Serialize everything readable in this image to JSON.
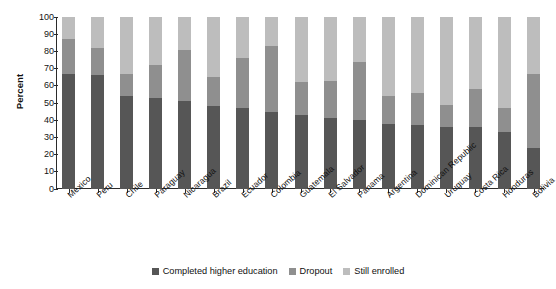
{
  "chart_data": {
    "type": "bar",
    "subtype": "stacked-bar-vertical",
    "title": "",
    "subtitle": "",
    "xlabel": "",
    "ylabel": "Percent",
    "ylim": [
      0,
      100
    ],
    "ytick_step": 10,
    "yticks": [
      100,
      90,
      80,
      70,
      60,
      50,
      40,
      30,
      20,
      10,
      0
    ],
    "grid": false,
    "legend_position": "bottom-center",
    "stacked_total": 100,
    "categories": [
      "Mexico",
      "Peru",
      "Chile",
      "Paraguay",
      "Nicaragua",
      "Brazil",
      "Ecuador",
      "Colombia",
      "Guatemala",
      "El Salvador",
      "Panama",
      "Argentina",
      "Dominican Republic",
      "Uruguay",
      "Costa Rica",
      "Honduras",
      "Bolivia"
    ],
    "series": [
      {
        "name": "Completed higher education",
        "color": "#565656",
        "values": [
          67,
          66,
          54,
          53,
          51,
          48,
          47,
          45,
          43,
          41,
          40,
          38,
          37,
          36,
          36,
          33,
          24
        ]
      },
      {
        "name": "Dropout",
        "color": "#8f8f8f",
        "values": [
          20,
          16,
          13,
          19,
          30,
          17,
          29,
          38,
          19,
          22,
          34,
          16,
          19,
          13,
          22,
          14,
          43
        ]
      },
      {
        "name": "Still enrolled",
        "color": "#bdbdbd",
        "values": [
          13,
          18,
          33,
          28,
          19,
          35,
          24,
          17,
          38,
          37,
          26,
          46,
          44,
          51,
          42,
          53,
          33
        ]
      }
    ]
  },
  "axis": {
    "y_title": "Percent"
  },
  "legend": {
    "items": [
      {
        "label": "Completed higher education",
        "color": "#565656"
      },
      {
        "label": "Dropout",
        "color": "#8f8f8f"
      },
      {
        "label": "Still enrolled",
        "color": "#bdbdbd"
      }
    ]
  }
}
